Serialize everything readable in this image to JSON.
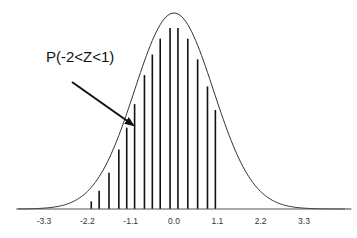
{
  "chart_data": {
    "type": "area",
    "title": "",
    "xlabel": "",
    "ylabel": "",
    "distribution": "standard normal",
    "mean": 0,
    "sd": 1,
    "xlim": [
      -4,
      4.5
    ],
    "x_ticks": [
      -3.3,
      -2.2,
      -1.1,
      0.0,
      1.1,
      2.2,
      3.3
    ],
    "x_tick_labels": [
      "-3.3",
      "-2.2",
      "-1.1",
      "0.0",
      "1.1",
      "2.2",
      "3.3"
    ],
    "shaded_region": {
      "from": -2,
      "to": 1,
      "style": "vertical lines"
    },
    "stripe_x": [
      -2.1,
      -1.9,
      -1.65,
      -1.4,
      -1.2,
      -1.0,
      -0.75,
      -0.55,
      -0.35,
      -0.1,
      0.1,
      0.35,
      0.6,
      0.85,
      1.05
    ],
    "grid": false,
    "legend": null,
    "annotations": [
      {
        "text": "P(-2<Z<1)",
        "arrow_to_x": -1.1
      }
    ]
  },
  "annotation": {
    "label": "P(-2<Z<1)"
  },
  "axis": {
    "ticks": [
      "-3.3",
      "-2.2",
      "-1.1",
      "0.0",
      "1.1",
      "2.2",
      "3.3"
    ]
  }
}
